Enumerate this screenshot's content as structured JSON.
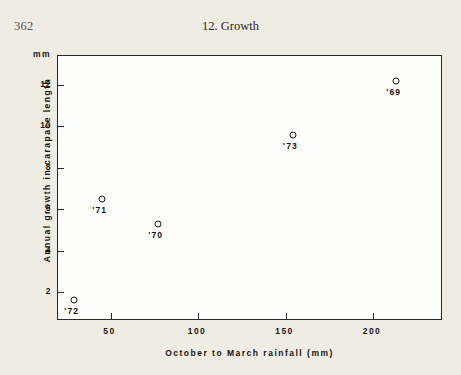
{
  "page": {
    "folio": "362",
    "running_head": "12. Growth",
    "background_color": "#efece4",
    "ink_color": "#16150f"
  },
  "chart_data": {
    "type": "scatter",
    "title": "",
    "xlabel": "October to March rainfall (mm)",
    "ylabel": "Annual growth in carapace length",
    "yunit": "mm",
    "xlim": [
      20,
      240
    ],
    "ylim": [
      0.6,
      13.4
    ],
    "xticks": [
      50,
      100,
      150,
      200
    ],
    "xticklabels": [
      "50",
      "100",
      "150",
      "200"
    ],
    "yticks": [
      2,
      4,
      6,
      8,
      10,
      12
    ],
    "yticklabels": [
      "2",
      "4",
      "6",
      "8",
      "10",
      "12"
    ],
    "grid": false,
    "legend": "none",
    "marker": "open-circle",
    "points": [
      {
        "label": "'72",
        "x": 29,
        "y": 1.6
      },
      {
        "label": "'71",
        "x": 45,
        "y": 6.5
      },
      {
        "label": "'70",
        "x": 77,
        "y": 5.3
      },
      {
        "label": "'73",
        "x": 154,
        "y": 9.6
      },
      {
        "label": "'69",
        "x": 213,
        "y": 12.2
      }
    ]
  }
}
